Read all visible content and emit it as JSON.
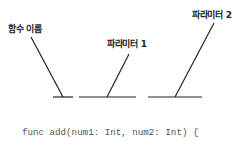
{
  "labels": {
    "function_name": "함수 이름",
    "parameter_1": "파라미터 1",
    "parameter_2": "파라미터 2"
  },
  "code": {
    "line1": "func add(num1: Int, num2: Int) {",
    "line2": "    print(num1 + num2)",
    "line3": "}"
  },
  "colors": {
    "line": "#222222",
    "code_text": "#555555",
    "label_text": "#222222"
  }
}
